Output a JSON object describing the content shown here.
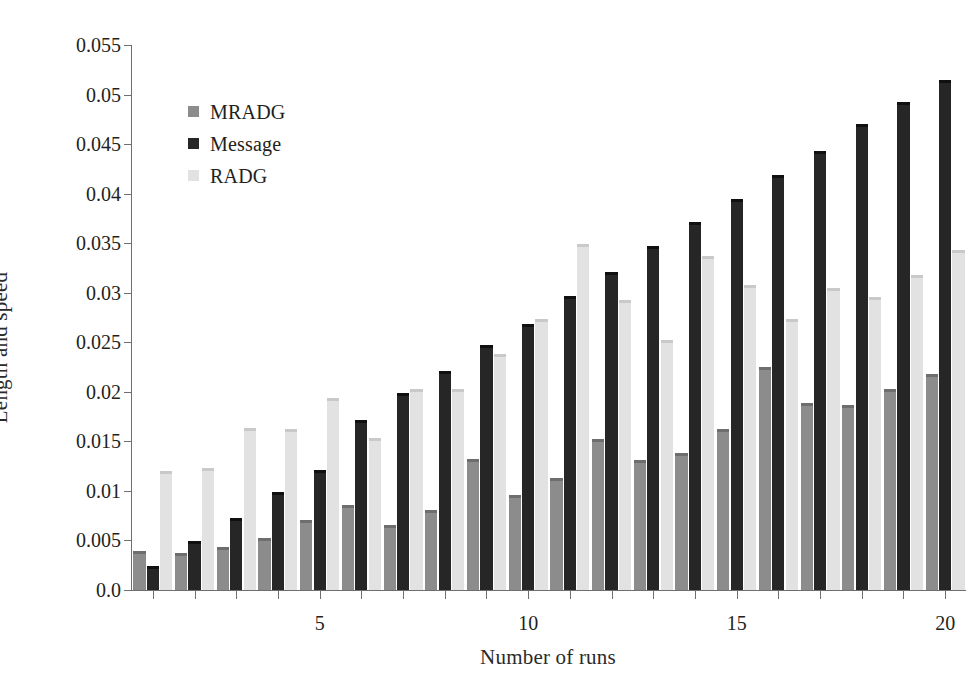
{
  "chart_data": {
    "type": "bar",
    "title": "",
    "xlabel": "Number of runs",
    "ylabel": "Length and speed",
    "grid": false,
    "legend_position": "upper-left-inside",
    "categories": [
      1,
      2,
      3,
      4,
      5,
      6,
      7,
      8,
      9,
      10,
      11,
      12,
      13,
      14,
      15,
      16,
      17,
      18,
      19,
      20
    ],
    "x_tick_labels": [
      "5",
      "10",
      "15",
      "20"
    ],
    "x_tick_label_values": [
      5,
      10,
      15,
      20
    ],
    "y_tick_labels": [
      "0.0",
      "0.005",
      "0.01",
      "0.015",
      "0.02",
      "0.025",
      "0.03",
      "0.035",
      "0.04",
      "0.045",
      "0.05",
      "0.055"
    ],
    "y_tick_values": [
      0.0,
      0.005,
      0.01,
      0.015,
      0.02,
      0.025,
      0.03,
      0.035,
      0.04,
      0.045,
      0.05,
      0.055
    ],
    "ylim": [
      0,
      0.055
    ],
    "series": [
      {
        "name": "MRADG",
        "color": "#8c8c8c",
        "cap_color": "#6e6e6e",
        "values": [
          0.0039,
          0.0037,
          0.0043,
          0.0052,
          0.0071,
          0.0086,
          0.0066,
          0.0081,
          0.0132,
          0.0096,
          0.0113,
          0.0152,
          0.0131,
          0.0138,
          0.0162,
          0.0225,
          0.0189,
          0.0187,
          0.0203,
          0.0218
        ]
      },
      {
        "name": "Message",
        "color": "#262626",
        "cap_color": "#101010",
        "values": [
          0.0024,
          0.0049,
          0.0073,
          0.0099,
          0.0121,
          0.0172,
          0.0199,
          0.0221,
          0.0247,
          0.0268,
          0.0297,
          0.0321,
          0.0347,
          0.0371,
          0.0395,
          0.0419,
          0.0443,
          0.047,
          0.0492,
          0.0515
        ]
      },
      {
        "name": "RADG",
        "color": "#e2e2e2",
        "cap_color": "#c9c9c9",
        "values": [
          0.012,
          0.0123,
          0.0163,
          0.0162,
          0.0194,
          0.0153,
          0.0203,
          0.0203,
          0.0238,
          0.0273,
          0.0349,
          0.0293,
          0.0252,
          0.0337,
          0.0308,
          0.0273,
          0.0305,
          0.0296,
          0.0318,
          0.0343
        ]
      }
    ]
  },
  "legend": {
    "items": [
      {
        "label": "MRADG"
      },
      {
        "label": "Message"
      },
      {
        "label": "RADG"
      }
    ]
  },
  "axes": {
    "y_title": "Length and speed",
    "x_title": "Number of runs"
  }
}
